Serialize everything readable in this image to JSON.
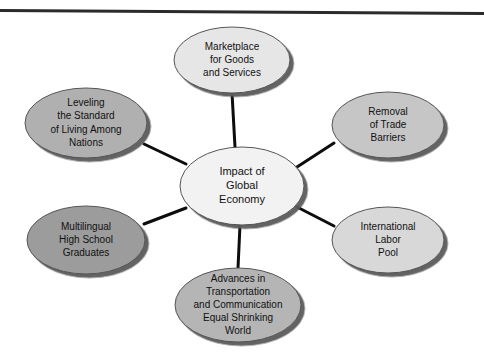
{
  "page": {
    "background_color": "#ffffff",
    "top_rule": {
      "name": "top-horizontal-rule",
      "color": "#2b2b2b",
      "thickness_px": 3
    }
  },
  "diagram": {
    "type": "hub-and-spoke",
    "connector_color": "#0d0d0d",
    "connector_width_px": 3,
    "ellipse_stroke_color": "#555555",
    "shadow_color": "#5a5a5a",
    "center": {
      "name": "center-node",
      "lines": [
        "Impact of",
        "Global",
        "Economy"
      ],
      "fill_color": "#f2f2f2",
      "cx": 242,
      "cy": 186,
      "rx": 62,
      "ry": 39,
      "font_size": 11
    },
    "satellites": [
      {
        "name": "node-marketplace",
        "lines": [
          "Marketplace",
          "for Goods",
          "and Services"
        ],
        "fill_color": "#e6e6e6",
        "cx": 232,
        "cy": 60,
        "rx": 58,
        "ry": 33,
        "font_size": 10
      },
      {
        "name": "node-removal-of-trade-barriers",
        "lines": [
          "Removal",
          "of Trade",
          "Barriers"
        ],
        "fill_color": "#c6c6c6",
        "cx": 388,
        "cy": 125,
        "rx": 56,
        "ry": 33,
        "font_size": 10
      },
      {
        "name": "node-international-labor-pool",
        "lines": [
          "International",
          "Labor",
          "Pool"
        ],
        "fill_color": "#d8d8d8",
        "cx": 388,
        "cy": 240,
        "rx": 56,
        "ry": 33,
        "font_size": 10
      },
      {
        "name": "node-advances-in-transportation",
        "lines": [
          "Advances in",
          "Transportation",
          "and Communication",
          "Equal Shrinking",
          "World"
        ],
        "fill_color": "#b5b5b5",
        "cx": 238,
        "cy": 305,
        "rx": 63,
        "ry": 37,
        "font_size": 10
      },
      {
        "name": "node-multilingual-high-school-graduates",
        "lines": [
          "Multilingual",
          "High School",
          "Graduates"
        ],
        "fill_color": "#9c9c9c",
        "cx": 86,
        "cy": 240,
        "rx": 59,
        "ry": 34,
        "font_size": 10
      },
      {
        "name": "node-leveling-the-standard",
        "lines": [
          "Leveling",
          "the Standard",
          "of Living Among",
          "Nations"
        ],
        "fill_color": "#b0b0b0",
        "cx": 86,
        "cy": 123,
        "rx": 61,
        "ry": 35,
        "font_size": 10
      }
    ],
    "connectors": [
      {
        "name": "connector-center-to-marketplace",
        "x1": 235,
        "y1": 147,
        "x2": 232,
        "y2": 93
      },
      {
        "name": "connector-center-to-removal",
        "x1": 297,
        "y1": 167,
        "x2": 334,
        "y2": 143
      },
      {
        "name": "connector-center-to-labor-pool",
        "x1": 297,
        "y1": 207,
        "x2": 334,
        "y2": 226
      },
      {
        "name": "connector-center-to-advances",
        "x1": 240,
        "y1": 225,
        "x2": 238,
        "y2": 268
      },
      {
        "name": "connector-center-to-multilingual",
        "x1": 186,
        "y1": 208,
        "x2": 144,
        "y2": 224
      },
      {
        "name": "connector-center-to-leveling",
        "x1": 186,
        "y1": 164,
        "x2": 144,
        "y2": 144
      }
    ]
  }
}
